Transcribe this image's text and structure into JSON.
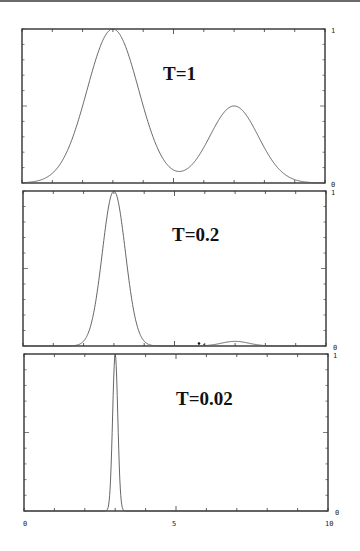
{
  "chart_data": [
    {
      "type": "line",
      "title": "T=1",
      "xlabel": "",
      "ylabel": "",
      "xlim": [
        0,
        10
      ],
      "ylim": [
        0,
        1
      ],
      "y_tick_labels": [
        "0",
        "1"
      ],
      "grid": false,
      "description": "Bimodal distribution: main peak at x=3, valley near x=5.2, secondary peak at x=7",
      "series": [
        {
          "name": "T=1",
          "x": [
            0,
            0.5,
            1,
            1.5,
            2,
            2.5,
            3,
            3.5,
            4,
            4.5,
            5,
            5.2,
            5.5,
            6,
            6.5,
            7,
            7.5,
            8,
            8.5,
            9,
            9.5,
            10
          ],
          "y": [
            0.01,
            0.04,
            0.12,
            0.27,
            0.5,
            0.8,
            1.0,
            0.93,
            0.67,
            0.38,
            0.21,
            0.19,
            0.22,
            0.33,
            0.46,
            0.51,
            0.45,
            0.3,
            0.15,
            0.06,
            0.02,
            0.005
          ]
        }
      ]
    },
    {
      "type": "line",
      "title": "T=0.2",
      "xlim": [
        0,
        10
      ],
      "ylim": [
        0,
        1
      ],
      "y_tick_labels": [
        "0",
        "1"
      ],
      "grid": false,
      "description": "Sharp peak at x=3 with a tiny bump near x=7",
      "series": [
        {
          "name": "T=0.2",
          "x": [
            0,
            1,
            1.5,
            2,
            2.5,
            2.75,
            3,
            3.25,
            3.5,
            4,
            4.5,
            5,
            6,
            6.5,
            7,
            7.5,
            8,
            10
          ],
          "y": [
            0,
            0.0,
            0.01,
            0.06,
            0.45,
            0.85,
            1.0,
            0.85,
            0.45,
            0.06,
            0.01,
            0.0,
            0.0,
            0.01,
            0.03,
            0.01,
            0.0,
            0
          ]
        }
      ]
    },
    {
      "type": "line",
      "title": "T=0.02",
      "xlim": [
        0,
        10
      ],
      "ylim": [
        0,
        1
      ],
      "x_tick_labels": [
        "0",
        "5",
        "10"
      ],
      "y_tick_labels": [
        "0",
        "1"
      ],
      "grid": false,
      "description": "Near-delta spike at x=3",
      "series": [
        {
          "name": "T=0.02",
          "x": [
            0,
            2.7,
            2.85,
            2.95,
            3.0,
            3.05,
            3.15,
            3.3,
            10
          ],
          "y": [
            0,
            0,
            0.1,
            0.75,
            1.0,
            0.75,
            0.1,
            0,
            0
          ]
        }
      ]
    }
  ],
  "labels": {
    "panel1": "T=1",
    "panel2": "T=0.2",
    "panel3": "T=0.02",
    "y_top": "1",
    "y_bottom": "0",
    "x0": "0",
    "x5": "5",
    "x10": "10"
  }
}
